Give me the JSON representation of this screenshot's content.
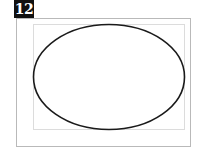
{
  "canvas": {
    "width": 202,
    "height": 160,
    "background_color": "#ffffff"
  },
  "index_badge": {
    "label": "12",
    "background_color": "#111111",
    "text_color": "#ffffff",
    "x": 14,
    "y": 0,
    "width": 20,
    "height": 18
  },
  "page_frame": {
    "name": "document-frame",
    "border_color": "#b9b9b9",
    "fill_color": "#ffffff",
    "x": 16,
    "y": 18,
    "width": 175,
    "height": 129
  },
  "selection_box": {
    "name": "selection-bounding-box",
    "border_color": "#dcdcdc",
    "handle_color": "#cfcfcf",
    "x": 33,
    "y": 24,
    "width": 152,
    "height": 106,
    "handles": [
      {
        "position": "top-center"
      },
      {
        "position": "middle-left"
      },
      {
        "position": "middle-right"
      },
      {
        "position": "bottom-center"
      }
    ]
  },
  "shape": {
    "name": "ellipse",
    "type": "ellipse",
    "stroke_color": "#1a1a1a",
    "stroke_width": 1.6,
    "fill": "none",
    "center_x": 109,
    "center_y": 77,
    "radius_x": 75.5,
    "radius_y": 52.5
  }
}
